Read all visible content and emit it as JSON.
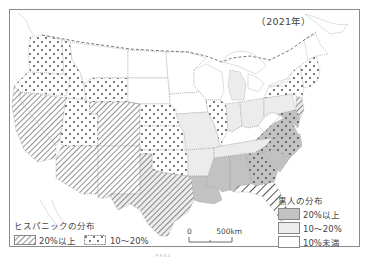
{
  "map": {
    "year_label": "（2021年）",
    "colors": {
      "black_20_plus": "#c2c2c2",
      "black_10_20": "#ececec",
      "black_under_10": "#ffffff",
      "pattern_ink": "#555555",
      "border": "#8a8a8a"
    },
    "hispanic_legend": {
      "title": "ヒスパニックの分布",
      "items": [
        {
          "pattern": "hatch",
          "label": "20%以上"
        },
        {
          "pattern": "dots",
          "label": "10〜20%"
        }
      ]
    },
    "black_legend": {
      "title": "黒人の分布",
      "items": [
        {
          "fill": "dark-gray",
          "label": "20%以上"
        },
        {
          "fill": "light-gray",
          "label": "10〜20%"
        },
        {
          "fill": "white",
          "label": "10%未満"
        }
      ]
    },
    "scale_bar": {
      "start": "0",
      "end": "500km"
    },
    "credit": "ＰＡＸＩ",
    "states": {
      "hispanic_20_plus": [
        "California",
        "Nevada",
        "Arizona",
        "New Mexico",
        "Texas",
        "Colorado",
        "Florida",
        "New Jersey"
      ],
      "hispanic_10_20": [
        "Washington",
        "Oregon",
        "Idaho",
        "Utah",
        "Wyoming",
        "Nebraska",
        "Kansas",
        "Oklahoma",
        "Illinois",
        "New York",
        "Connecticut",
        "Rhode Island",
        "Massachusetts",
        "Georgia",
        "North Carolina",
        "Virginia",
        "Maryland",
        "Delaware"
      ],
      "black_20_plus": [
        "Louisiana",
        "Mississippi",
        "Alabama",
        "Georgia",
        "South Carolina",
        "North Carolina",
        "Maryland",
        "Delaware",
        "Virginia"
      ],
      "black_10_20": [
        "Illinois",
        "Michigan",
        "Ohio",
        "Pennsylvania",
        "New York",
        "Tennessee",
        "Arkansas",
        "Missouri",
        "Texas",
        "Florida",
        "New Jersey",
        "Connecticut",
        "Indiana",
        "Kentucky"
      ]
    }
  }
}
